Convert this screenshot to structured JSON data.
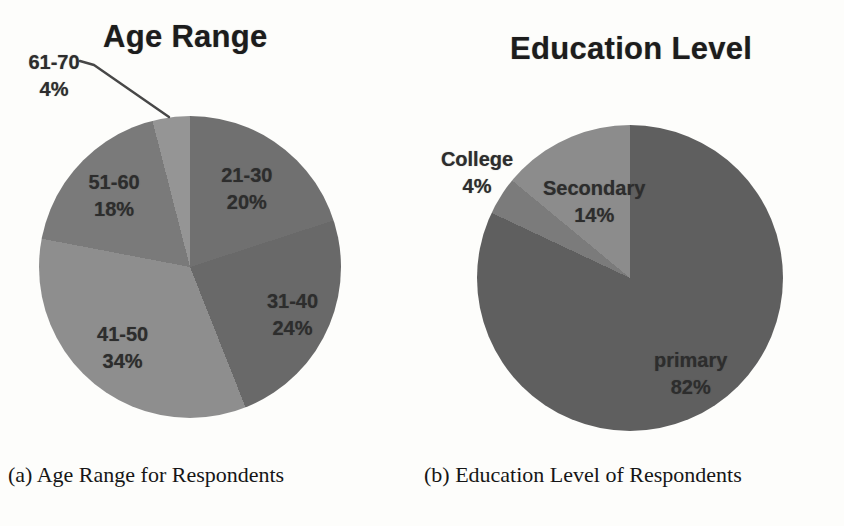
{
  "page": {
    "background": "#fdfdfb"
  },
  "chart_data": [
    {
      "type": "pie",
      "title": "Age Range",
      "caption": "(a) Age Range for Respondents",
      "unit": "%",
      "start_angle_deg": 0,
      "direction": "clockwise",
      "legend": "none",
      "label_style": "category-and-percent",
      "slices": [
        {
          "label": "21-30",
          "value": 20,
          "color": "#707070",
          "label_frac": 0.64
        },
        {
          "label": "31-40",
          "value": 24,
          "color": "#696969",
          "label_frac": 0.75
        },
        {
          "label": "41-50",
          "value": 34,
          "color": "#8e8e8e",
          "label_frac": 0.7
        },
        {
          "label": "51-60",
          "value": 18,
          "color": "#7a7a7a",
          "label_frac": 0.69
        },
        {
          "label": "61-70",
          "value": 4,
          "color": "#959595",
          "outside": true
        }
      ]
    },
    {
      "type": "pie",
      "title": "Education Level",
      "caption": "(b) Education Level of Respondents",
      "unit": "%",
      "start_angle_deg": 0,
      "direction": "clockwise",
      "legend": "none",
      "label_style": "category-and-percent",
      "slices": [
        {
          "label": "primary",
          "value": 82,
          "color": "#5f5f5f",
          "label_frac": 0.74
        },
        {
          "label": "College",
          "value": 4,
          "color": "#7b7b7b",
          "outside": true
        },
        {
          "label": "Secondary",
          "value": 14,
          "color": "#8c8c8c",
          "label_frac": 0.55
        }
      ]
    }
  ]
}
